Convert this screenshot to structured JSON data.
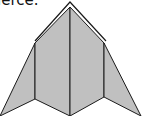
{
  "caption": {
    "text": "ierce."
  },
  "diagram": {
    "fill_color": "#c0c0c0",
    "stroke_color": "#1a1a1a",
    "panels": 4
  }
}
